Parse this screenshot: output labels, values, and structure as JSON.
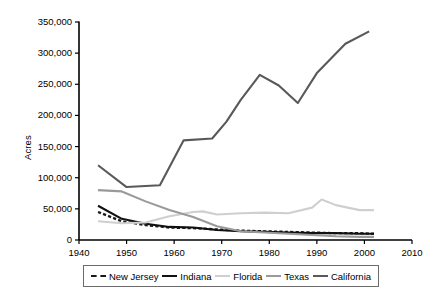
{
  "chart_data": {
    "type": "line",
    "title": "",
    "xlabel": "",
    "ylabel": "Acres",
    "xlim": [
      1940,
      2010
    ],
    "ylim": [
      0,
      350000
    ],
    "xticks": [
      1940,
      1950,
      1960,
      1970,
      1980,
      1990,
      2000,
      2010
    ],
    "xtick_labels": [
      "1940",
      "1950",
      "1960",
      "1970",
      "1980",
      "1990",
      "2000",
      "2010"
    ],
    "yticks": [
      0,
      50000,
      100000,
      150000,
      200000,
      250000,
      300000,
      350000
    ],
    "ytick_labels": [
      "0",
      "50,000",
      "100,000",
      "150,000",
      "200,000",
      "250,000",
      "300,000",
      "350,000"
    ],
    "grid": false,
    "legend_position": "bottom",
    "series": [
      {
        "name": "New Jersey",
        "style": "dashed",
        "color": "#1a1a1a",
        "x": [
          1944,
          1949,
          1954,
          1959,
          1964,
          1969,
          1974,
          1979,
          1984,
          1989,
          1994,
          1999,
          2002
        ],
        "values": [
          45000,
          30000,
          24000,
          20000,
          19000,
          17000,
          15000,
          14000,
          13000,
          12000,
          11000,
          11000,
          10000
        ]
      },
      {
        "name": "Indiana",
        "style": "solid",
        "color": "#111111",
        "x": [
          1944,
          1949,
          1954,
          1959,
          1964,
          1969,
          1974,
          1979,
          1984,
          1989,
          1994,
          1999,
          2002
        ],
        "values": [
          55000,
          34000,
          26000,
          21000,
          20000,
          16000,
          14000,
          13000,
          12000,
          11000,
          11000,
          10000,
          10000
        ]
      },
      {
        "name": "Florida",
        "style": "solid",
        "color": "#cfcfcf",
        "x": [
          1944,
          1949,
          1954,
          1959,
          1964,
          1966,
          1969,
          1974,
          1979,
          1984,
          1989,
          1991,
          1994,
          1999,
          2002
        ],
        "values": [
          30000,
          27000,
          28000,
          38000,
          45000,
          46000,
          41000,
          43000,
          44000,
          43000,
          52000,
          65000,
          56000,
          48000,
          48000
        ]
      },
      {
        "name": "Texas",
        "style": "solid",
        "color": "#9a9a9a",
        "x": [
          1944,
          1949,
          1954,
          1959,
          1964,
          1969,
          1974,
          1979,
          1984,
          1989,
          1994,
          1999,
          2002
        ],
        "values": [
          80000,
          78000,
          62000,
          48000,
          37000,
          22000,
          14000,
          12000,
          10000,
          8000,
          6000,
          5000,
          5000
        ]
      },
      {
        "name": "California",
        "style": "solid",
        "color": "#595959",
        "x": [
          1944,
          1950,
          1957,
          1962,
          1968,
          1971,
          1974,
          1978,
          1982,
          1986,
          1990,
          1996,
          2001
        ],
        "values": [
          120000,
          85000,
          88000,
          160000,
          163000,
          190000,
          225000,
          265000,
          248000,
          220000,
          268000,
          315000,
          335000
        ]
      }
    ]
  },
  "legend": {
    "items": [
      {
        "label": "New Jersey"
      },
      {
        "label": "Indiana"
      },
      {
        "label": "Florida"
      },
      {
        "label": "Texas"
      },
      {
        "label": "California"
      }
    ]
  }
}
